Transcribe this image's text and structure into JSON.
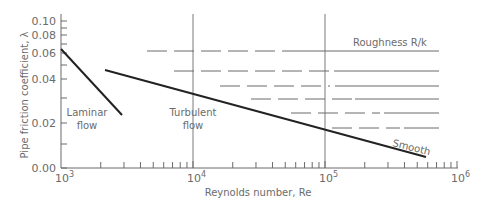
{
  "chart_data": {
    "type": "line",
    "title": "",
    "xlabel": "Reynolds number, Re",
    "ylabel": "Pipe friction coefficient, λ",
    "xscale": "log",
    "xlim": [
      1000,
      1000000
    ],
    "x_ticks": [
      "10^3",
      "10^4",
      "10^5",
      "10^6"
    ],
    "y_ticks": [
      "0.00",
      "0.02",
      "0.04",
      "0.06",
      "0.08",
      "0.10"
    ],
    "grid": "vertical lines at 10^4 and 10^5",
    "series": [
      {
        "name": "Laminar flow",
        "style": "solid",
        "points": [
          [
            1000,
            0.064
          ],
          [
            2800,
            0.023
          ]
        ]
      },
      {
        "name": "Smooth (turbulent)",
        "style": "solid",
        "points": [
          [
            2000,
            0.046
          ],
          [
            10000,
            0.031
          ],
          [
            100000,
            0.018
          ],
          [
            600000,
            0.011
          ]
        ]
      },
      {
        "name": "Roughness R/k 1",
        "style": "dashed-then-solid",
        "y_px": 51,
        "x_start": 4500
      },
      {
        "name": "Roughness R/k 2",
        "style": "dashed-then-solid",
        "y_px": 71,
        "x_start": 7000
      },
      {
        "name": "Roughness R/k 3",
        "style": "dashed-then-solid",
        "y_px": 86,
        "x_start": 15000
      },
      {
        "name": "Roughness R/k 4",
        "style": "dashed-then-solid",
        "y_px": 99,
        "x_start": 25000
      },
      {
        "name": "Roughness R/k 5",
        "style": "dashed-then-solid",
        "y_px": 113,
        "x_start": 50000
      },
      {
        "name": "Roughness R/k 6",
        "style": "dashed-then-solid",
        "y_px": 128,
        "x_start": 100000
      }
    ],
    "annotations": [
      "Laminar flow",
      "Turbulent flow",
      "Roughness R/k",
      "Smooth"
    ]
  },
  "labels": {
    "xlabel": "Reynolds number, Re",
    "ylabel": "Pipe friction coefficient, λ",
    "roughness": "Roughness R/k",
    "smooth": "Smooth",
    "laminar1": "Laminar",
    "laminar2": "flow",
    "turbulent1": "Turbulent",
    "turbulent2": "flow"
  },
  "yticks": [
    {
      "label": "0.10",
      "y": 21
    },
    {
      "label": "0.08",
      "y": 35
    },
    {
      "label": "0.06",
      "y": 53
    },
    {
      "label": "0.04",
      "y": 79
    },
    {
      "label": "0.02",
      "y": 123
    },
    {
      "label": "0.00",
      "y": 168
    }
  ],
  "xticks": [
    {
      "base": "10",
      "exp": "3",
      "x": 61
    },
    {
      "base": "10",
      "exp": "4",
      "x": 193
    },
    {
      "base": "10",
      "exp": "5",
      "x": 325
    },
    {
      "base": "10",
      "exp": "6",
      "x": 457
    }
  ]
}
